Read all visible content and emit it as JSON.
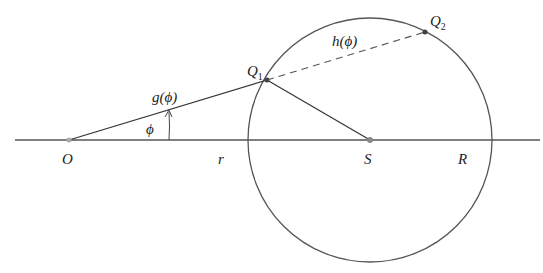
{
  "diagram": {
    "colors": {
      "stroke": "#333333",
      "point": "#888888",
      "background": "#ffffff"
    },
    "points": {
      "O": {
        "label": "O",
        "x": 69,
        "y": 140
      },
      "S": {
        "label": "S",
        "x": 370,
        "y": 140
      },
      "Q1": {
        "label": "Q",
        "sub": "1",
        "x": 267,
        "y": 80
      },
      "Q2": {
        "label": "Q",
        "sub": "2",
        "x": 425,
        "y": 32
      }
    },
    "circle": {
      "cx": 370,
      "cy": 140,
      "r": 122
    },
    "labels": {
      "g": "g(ϕ)",
      "h": "h(ϕ)",
      "phi": "ϕ",
      "r": "r",
      "R": "R"
    }
  }
}
